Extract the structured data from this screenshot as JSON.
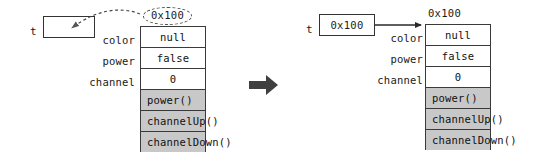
{
  "diagram": {
    "colors": {
      "stroke": "#3a3a3a",
      "method_row_fill": "#c8c8c8",
      "field_row_fill": "#ffffff",
      "transition_arrow": "#3f3f3f",
      "dashed_stroke": "#4a4a4a"
    }
  },
  "before": {
    "variable": {
      "label": "t",
      "value": ""
    },
    "address_caption": "0x100",
    "object": {
      "fields": [
        {
          "name": "color",
          "value": "null"
        },
        {
          "name": "power",
          "value": "false"
        },
        {
          "name": "channel",
          "value": "0"
        }
      ],
      "methods": [
        {
          "label": "power()"
        },
        {
          "label": "channelUp()"
        },
        {
          "label": "channelDown()"
        }
      ]
    }
  },
  "after": {
    "variable": {
      "label": "t",
      "value": "0x100"
    },
    "address_caption": "0x100",
    "object": {
      "fields": [
        {
          "name": "color",
          "value": "null"
        },
        {
          "name": "power",
          "value": "false"
        },
        {
          "name": "channel",
          "value": "0"
        }
      ],
      "methods": [
        {
          "label": "power()"
        },
        {
          "label": "channelUp()"
        },
        {
          "label": "channelDown()"
        }
      ]
    }
  }
}
